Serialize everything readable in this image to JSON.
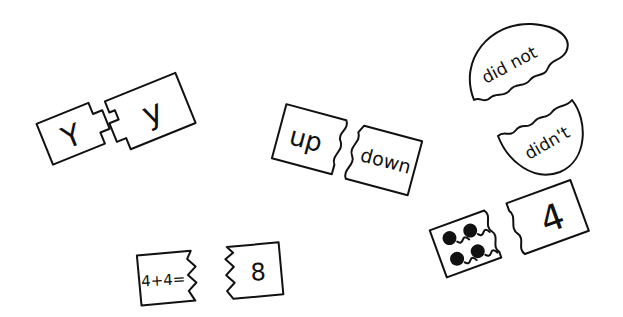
{
  "illustration": {
    "background": "#ffffff",
    "ink_color": "#111111",
    "pairs": [
      {
        "id": "letter-case",
        "left": "Y",
        "right": "y",
        "join": "jigsaw-notch"
      },
      {
        "id": "opposites",
        "left": "up",
        "right": "down",
        "join": "wavy"
      },
      {
        "id": "contraction",
        "left": "did not",
        "right": "didn't",
        "join": "wavy-circle"
      },
      {
        "id": "count-dots",
        "left_dots": 4,
        "right": "4",
        "join": "wavy"
      },
      {
        "id": "addition",
        "left": "4+4=",
        "right": "8",
        "join": "zigzag"
      }
    ]
  }
}
